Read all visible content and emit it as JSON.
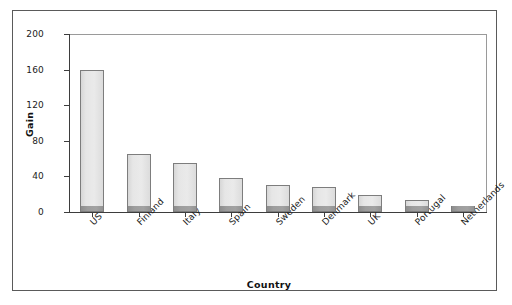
{
  "chart_data": {
    "type": "bar",
    "title": "",
    "xlabel": "Country",
    "ylabel": "Gain",
    "categories": [
      "US",
      "Finland",
      "Italy",
      "Spain",
      "Sweden",
      "Denmark",
      "UK",
      "Portugal",
      "Netherlands"
    ],
    "values": [
      160,
      65,
      55,
      38,
      30,
      28,
      19,
      13,
      7
    ],
    "series": [
      {
        "name": "Gain",
        "values": [
          160,
          65,
          55,
          38,
          30,
          28,
          19,
          13,
          7
        ]
      },
      {
        "name": "base-segment",
        "values": [
          6,
          6,
          6,
          6,
          6,
          6,
          6,
          6,
          7
        ]
      }
    ],
    "ylim": [
      0,
      200
    ],
    "yticks": [
      0,
      40,
      80,
      120,
      160,
      200
    ],
    "ytick_labels": [
      "0",
      "40",
      "80",
      "120",
      "160",
      "200"
    ],
    "grid": false,
    "legend": "none",
    "bar_fill_color": "#e6e6e6",
    "bar_base_color": "#9a9a9a",
    "bar_edge_color": "#7d7d7d",
    "axis_color": "#3d3d3d",
    "frame_color": "#5a5a5a",
    "background_color": "#ffffff",
    "xtick_rotation": -45
  }
}
